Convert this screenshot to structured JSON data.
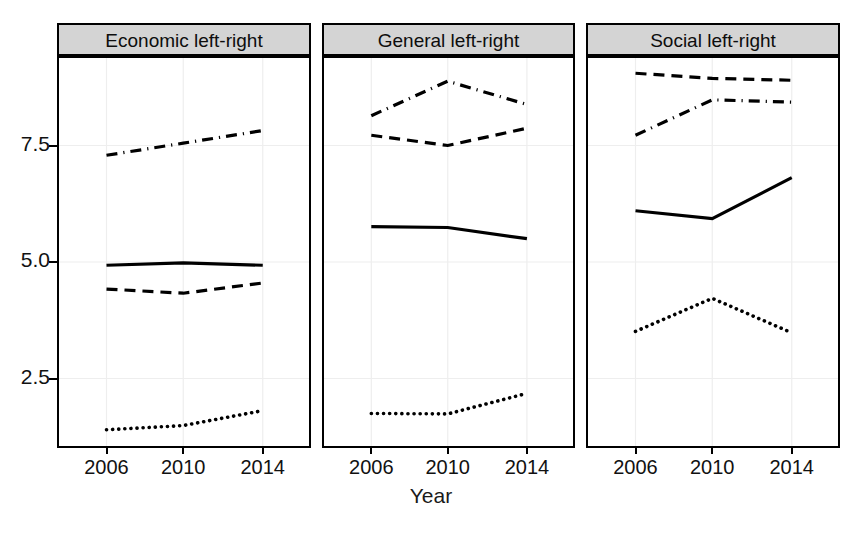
{
  "figure": {
    "xlabel": "Year",
    "ylabel": "",
    "background": "#ffffff",
    "strip_background": "#d4d4d4",
    "line_color": "#000000"
  },
  "axis": {
    "y_ticks": [
      "2.5",
      "5.0",
      "7.5"
    ],
    "y_tick_values": [
      2.5,
      5.0,
      7.5
    ],
    "x_ticks": [
      "2006",
      "2010",
      "2014"
    ],
    "x_tick_values": [
      2006,
      2010,
      2014
    ],
    "ylim": [
      0.6,
      9.6
    ],
    "xlim": [
      2004.4,
      2015.6
    ]
  },
  "panels": [
    {
      "title": "Economic left-right",
      "series": [
        {
          "name": "series-dashdot",
          "style": "dashdot",
          "values": [
            7.29,
            7.55,
            7.82
          ]
        },
        {
          "name": "series-solid",
          "style": "solid",
          "values": [
            4.93,
            4.98,
            4.93
          ]
        },
        {
          "name": "series-dashed",
          "style": "dashed",
          "values": [
            4.42,
            4.33,
            4.55
          ]
        },
        {
          "name": "series-dotted",
          "style": "dotted",
          "values": [
            1.4,
            1.49,
            1.81
          ]
        }
      ]
    },
    {
      "title": "General left-right",
      "series": [
        {
          "name": "series-dashdot",
          "style": "dashdot",
          "values": [
            8.14,
            8.88,
            8.38
          ]
        },
        {
          "name": "series-dashed",
          "style": "dashed",
          "values": [
            7.72,
            7.5,
            7.87
          ]
        },
        {
          "name": "series-solid",
          "style": "solid",
          "values": [
            5.76,
            5.74,
            5.5
          ]
        },
        {
          "name": "series-dotted",
          "style": "dotted",
          "values": [
            1.75,
            1.74,
            2.18
          ]
        }
      ]
    },
    {
      "title": "Social left-right",
      "series": [
        {
          "name": "series-dashed",
          "style": "dashed",
          "values": [
            9.05,
            8.94,
            8.9
          ]
        },
        {
          "name": "series-dashdot",
          "style": "dashdot",
          "values": [
            7.72,
            8.48,
            8.43
          ]
        },
        {
          "name": "series-solid",
          "style": "solid",
          "values": [
            6.1,
            5.93,
            6.81
          ]
        },
        {
          "name": "series-dotted",
          "style": "dotted",
          "values": [
            3.51,
            4.22,
            3.48
          ]
        }
      ]
    }
  ],
  "chart_data": {
    "type": "line",
    "title": "",
    "xlabel": "Year",
    "ylabel": "",
    "x": [
      2006,
      2010,
      2014
    ],
    "xlim": [
      2004.4,
      2015.6
    ],
    "ylim": [
      0.6,
      9.6
    ],
    "grid": true,
    "legend": "none",
    "panels": [
      {
        "title": "Economic left-right",
        "series": [
          {
            "name": "dash-dot line",
            "linestyle": "dashdot",
            "values": [
              7.29,
              7.55,
              7.82
            ]
          },
          {
            "name": "solid line",
            "linestyle": "solid",
            "values": [
              4.93,
              4.98,
              4.93
            ]
          },
          {
            "name": "dashed line",
            "linestyle": "dashed",
            "values": [
              4.42,
              4.33,
              4.55
            ]
          },
          {
            "name": "dotted line",
            "linestyle": "dotted",
            "values": [
              1.4,
              1.49,
              1.81
            ]
          }
        ]
      },
      {
        "title": "General left-right",
        "series": [
          {
            "name": "dash-dot line",
            "linestyle": "dashdot",
            "values": [
              8.14,
              8.88,
              8.38
            ]
          },
          {
            "name": "dashed line",
            "linestyle": "dashed",
            "values": [
              7.72,
              7.5,
              7.87
            ]
          },
          {
            "name": "solid line",
            "linestyle": "solid",
            "values": [
              5.76,
              5.74,
              5.5
            ]
          },
          {
            "name": "dotted line",
            "linestyle": "dotted",
            "values": [
              1.75,
              1.74,
              2.18
            ]
          }
        ]
      },
      {
        "title": "Social left-right",
        "series": [
          {
            "name": "dashed line",
            "linestyle": "dashed",
            "values": [
              9.05,
              8.94,
              8.9
            ]
          },
          {
            "name": "dash-dot line",
            "linestyle": "dashdot",
            "values": [
              7.72,
              8.48,
              8.43
            ]
          },
          {
            "name": "solid line",
            "linestyle": "solid",
            "values": [
              6.1,
              5.93,
              6.81
            ]
          },
          {
            "name": "dotted line",
            "linestyle": "dotted",
            "values": [
              3.51,
              4.22,
              3.48
            ]
          }
        ]
      }
    ]
  }
}
